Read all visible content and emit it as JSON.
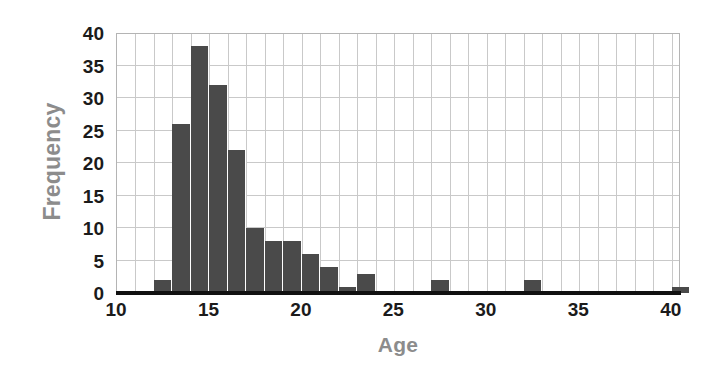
{
  "chart_data": {
    "type": "bar",
    "title": "",
    "subtitle": "",
    "xlabel": "Age",
    "ylabel": "Frequency",
    "xlim": [
      10,
      40.5
    ],
    "ylim": [
      0,
      40
    ],
    "bin_width": 1,
    "grid": true,
    "legend": null,
    "bar_color": "#4a4a4a",
    "grid_color": "#c9c9c9",
    "axis_color": "#111111",
    "label_color": "#8c8c8c",
    "tick_color": "#1b1b1b",
    "xticks": [
      10,
      15,
      20,
      25,
      30,
      35,
      40
    ],
    "yticks": [
      0,
      5,
      10,
      15,
      20,
      25,
      30,
      35,
      40
    ],
    "categories": [
      12,
      13,
      14,
      15,
      16,
      17,
      18,
      19,
      20,
      21,
      22,
      23,
      27,
      32,
      40
    ],
    "values": [
      2,
      26,
      38,
      32,
      22,
      10,
      8,
      8,
      6,
      4,
      1,
      3,
      2,
      2,
      1
    ],
    "bins": [
      {
        "start": 12,
        "end": 13,
        "count": 2
      },
      {
        "start": 13,
        "end": 14,
        "count": 26
      },
      {
        "start": 14,
        "end": 15,
        "count": 38
      },
      {
        "start": 15,
        "end": 16,
        "count": 32
      },
      {
        "start": 16,
        "end": 17,
        "count": 22
      },
      {
        "start": 17,
        "end": 18,
        "count": 10
      },
      {
        "start": 18,
        "end": 19,
        "count": 8
      },
      {
        "start": 19,
        "end": 20,
        "count": 8
      },
      {
        "start": 20,
        "end": 21,
        "count": 6
      },
      {
        "start": 21,
        "end": 22,
        "count": 4
      },
      {
        "start": 22,
        "end": 23,
        "count": 1
      },
      {
        "start": 23,
        "end": 24,
        "count": 3
      },
      {
        "start": 27,
        "end": 28,
        "count": 2
      },
      {
        "start": 32,
        "end": 33,
        "count": 2
      },
      {
        "start": 40,
        "end": 41,
        "count": 1
      }
    ]
  }
}
